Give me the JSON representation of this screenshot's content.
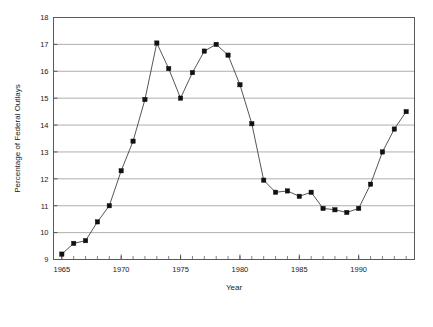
{
  "chart_data": {
    "type": "line",
    "title": "",
    "xlabel": "Year",
    "ylabel": "Percentage of Federal Outlays",
    "xlim": [
      1964.3,
      1994.7
    ],
    "ylim": [
      9,
      18
    ],
    "xticks": [
      1965,
      1970,
      1975,
      1980,
      1985,
      1990
    ],
    "xtick_labels": [
      "1965",
      "1970",
      "1975",
      "1980",
      "1985",
      "1990"
    ],
    "yticks": [
      9,
      10,
      11,
      12,
      13,
      14,
      15,
      16,
      17,
      18
    ],
    "ytick_labels": [
      "9",
      "10",
      "11",
      "12",
      "13",
      "14",
      "15",
      "16",
      "17",
      "18"
    ],
    "minor_xticks_step": 1,
    "grid": "horizontal",
    "legend": "none",
    "marker": "filled-square",
    "x": [
      1965,
      1966,
      1967,
      1968,
      1969,
      1970,
      1971,
      1972,
      1973,
      1974,
      1975,
      1976,
      1977,
      1978,
      1979,
      1980,
      1981,
      1982,
      1983,
      1984,
      1985,
      1986,
      1987,
      1988,
      1989,
      1990,
      1991,
      1992,
      1993,
      1994
    ],
    "values": [
      9.2,
      9.6,
      9.7,
      10.4,
      11.0,
      12.3,
      13.4,
      14.95,
      17.05,
      16.1,
      15.0,
      15.95,
      16.75,
      17.0,
      16.6,
      15.5,
      14.05,
      11.95,
      11.5,
      11.55,
      11.35,
      11.5,
      10.9,
      10.85,
      10.75,
      10.9,
      11.8,
      13.0,
      13.85,
      14.5
    ]
  }
}
